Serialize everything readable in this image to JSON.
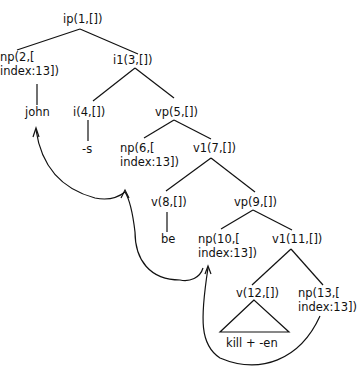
{
  "diagram": {
    "type": "syntax-tree",
    "nodes": {
      "n1": {
        "label": "ip(1,[])"
      },
      "n2": {
        "line1": "np(2,[",
        "line2": "index:13])"
      },
      "n3": {
        "label": "i1(3,[])"
      },
      "john": {
        "label": "john"
      },
      "n4": {
        "label": "i(4,[])"
      },
      "s": {
        "label": "-s"
      },
      "n5": {
        "label": "vp(5,[])"
      },
      "n6": {
        "line1": "np(6,[",
        "line2": "index:13])"
      },
      "n7": {
        "label": "v1(7,[])"
      },
      "n8": {
        "label": "v(8,[])"
      },
      "be": {
        "label": "be"
      },
      "n9": {
        "label": "vp(9,[])"
      },
      "n10": {
        "line1": "np(10,[",
        "line2": "index:13])"
      },
      "n11": {
        "label": "v1(11,[])"
      },
      "n12": {
        "label": "v(12,[])"
      },
      "n13": {
        "line1": "np(13,[",
        "line2": "index:13])"
      },
      "kill": {
        "label": "kill + -en"
      }
    },
    "edges": [
      [
        "n1",
        "n2"
      ],
      [
        "n1",
        "n3"
      ],
      [
        "n2",
        "john"
      ],
      [
        "n3",
        "n4"
      ],
      [
        "n3",
        "n5"
      ],
      [
        "n4",
        "s"
      ],
      [
        "n5",
        "n6"
      ],
      [
        "n5",
        "n7"
      ],
      [
        "n7",
        "n8"
      ],
      [
        "n7",
        "n9"
      ],
      [
        "n8",
        "be"
      ],
      [
        "n9",
        "n10"
      ],
      [
        "n9",
        "n11"
      ],
      [
        "n11",
        "n12"
      ],
      [
        "n11",
        "n13"
      ],
      [
        "n12",
        "kill"
      ]
    ],
    "movement_arrows": [
      {
        "from": "n13",
        "to": "n10"
      },
      {
        "from": "n10",
        "to": "n6"
      },
      {
        "from": "n6",
        "to": "john"
      }
    ],
    "colors": {
      "ink": "#111111",
      "background": "#ffffff"
    }
  }
}
